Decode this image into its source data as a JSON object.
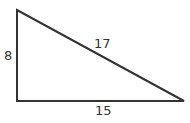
{
  "diagram": {
    "type": "right-triangle",
    "vertices": {
      "top_left": [
        17,
        10
      ],
      "bottom_left": [
        17,
        101
      ],
      "bottom_right": [
        184,
        101
      ]
    },
    "stroke_color": "#333333",
    "labels": {
      "left_side": "8",
      "hypotenuse": "17",
      "bottom_side": "15"
    }
  }
}
